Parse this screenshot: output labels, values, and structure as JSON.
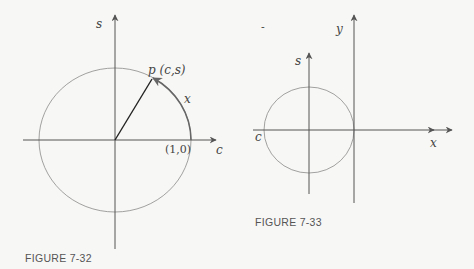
{
  "figures": [
    {
      "caption": "FIGURE 7-32",
      "labels": {
        "vertical_axis": "s",
        "horizontal_axis": "c",
        "point": "p (c,s)",
        "arc": "x",
        "intercept": "(1,0)"
      }
    },
    {
      "caption": "FIGURE 7-33",
      "labels": {
        "circle_vertical_axis": "s",
        "circle_horizontal_axis": "c",
        "vertical_axis": "y",
        "horizontal_axis": "x"
      }
    }
  ],
  "colors": {
    "axis": "#555555",
    "circle": "#8a8a8a",
    "radius": "#222222",
    "arc": "#666666",
    "background": "#f7f7f5"
  }
}
